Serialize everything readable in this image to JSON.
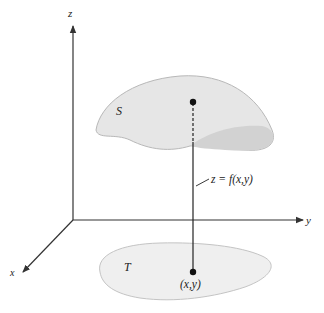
{
  "figure": {
    "axes": {
      "z_label": "z",
      "y_label": "y",
      "x_label": "x"
    },
    "surface": {
      "label": "S",
      "fill_color": "#e6e6e6",
      "underside_color": "#d2d2d2",
      "edge_color": "#b8b8b8"
    },
    "region": {
      "label": "T",
      "fill_color": "#efefef",
      "edge_color": "#c4c4c4"
    },
    "annotations": {
      "function_label": "z = f(x,y)",
      "point_label": "(x,y)"
    },
    "colors": {
      "axis": "#333333",
      "line": "#222222",
      "text": "#222222"
    }
  }
}
